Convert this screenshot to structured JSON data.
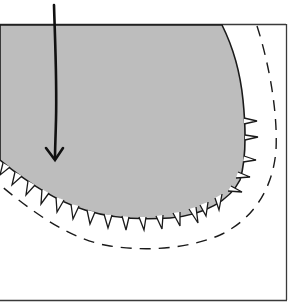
{
  "diagram": {
    "type": "schematic-cross-section",
    "colors": {
      "background": "#ffffff",
      "fill": "#bdbdbd",
      "stroke": "#1a1a1a",
      "frame": "#3a3a3a"
    },
    "elements": {
      "frame": {
        "top": 24,
        "right": 286,
        "bottom": 300
      },
      "arrow": {
        "x": 54,
        "y_start": 4,
        "y_end": 160,
        "direction": "down"
      },
      "dashed_contour": {
        "style": "dashed"
      },
      "serrated_edge": {
        "teeth": "outward-pointing spikes along lower boundary"
      }
    },
    "labels": []
  }
}
